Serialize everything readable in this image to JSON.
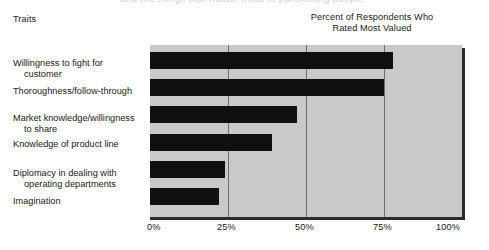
{
  "figure": {
    "bleed_text": "and the things that matter most to purchasing people",
    "traits_heading": "Traits",
    "value_heading_line1": "Percent of Respondents Who",
    "value_heading_line2": "Rated Most Valued"
  },
  "chart_data": {
    "type": "bar",
    "orientation": "horizontal",
    "title": "",
    "subtitle": "",
    "xlabel": "Percent of Respondents Who Rated Most Valued",
    "ylabel": "Traits",
    "categories": [
      "Willingness to fight for customer",
      "Thoroughness/follow-through",
      "Market knowledge/willingness to share",
      "Knowledge of product line",
      "Diplomacy in dealing with operating departments",
      "Imagination"
    ],
    "category_lines": [
      [
        "Willingness to fight for",
        "customer"
      ],
      [
        "Thoroughness/follow-through"
      ],
      [
        "Market knowledge/willingness",
        "to share"
      ],
      [
        "Knowledge of product line"
      ],
      [
        "Diplomacy in dealing with",
        "operating departments"
      ],
      [
        "Imagination"
      ]
    ],
    "values": [
      78,
      75,
      47,
      39,
      24,
      22
    ],
    "xlim": [
      0,
      100
    ],
    "xticks": [
      0,
      25,
      50,
      75,
      100
    ],
    "xtick_labels": [
      "0%",
      "25%",
      "50%",
      "75%",
      "100%"
    ],
    "grid": true,
    "grid_axis": "x",
    "legend": false,
    "series_color": "#101010",
    "plot_background": "#c9c9c9",
    "gridline_color": "#6e6e6e",
    "axis_color": "#2b2b2b"
  }
}
